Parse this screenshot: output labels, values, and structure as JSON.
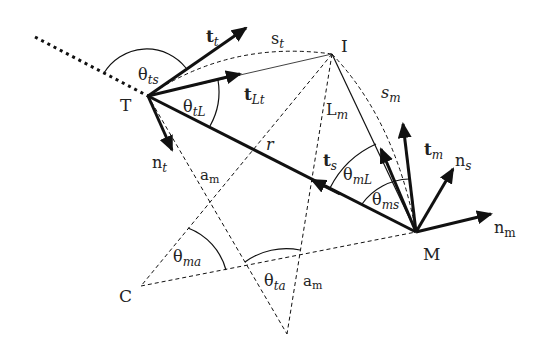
{
  "diagram": {
    "points": {
      "T": {
        "label": "T",
        "x": 148,
        "y": 96
      },
      "I": {
        "label": "I",
        "x": 332,
        "y": 54
      },
      "M": {
        "label": "M",
        "x": 416,
        "y": 232
      },
      "C": {
        "label": "C",
        "x": 141,
        "y": 286
      },
      "B": {
        "label": "",
        "x": 287,
        "y": 334
      }
    },
    "labels": {
      "t_t": {
        "main": "t",
        "sub": "t"
      },
      "t_Lt": {
        "main": "t",
        "sub": "Lt"
      },
      "n_t": {
        "main": "n",
        "sub": "t"
      },
      "s_t": {
        "main": "s",
        "sub": "t"
      },
      "s_m": {
        "main": "s",
        "sub": "m"
      },
      "L_m": {
        "main": "L",
        "sub": "m"
      },
      "r": {
        "main": "r"
      },
      "t_s": {
        "main": "t",
        "sub": "s"
      },
      "t_m": {
        "main": "t",
        "sub": "m"
      },
      "n_s": {
        "main": "n",
        "sub": "s"
      },
      "n_m": {
        "main": "n",
        "sub": "m"
      },
      "a_m_1": {
        "main": "a",
        "sub": "m"
      },
      "a_m_2": {
        "main": "a",
        "sub": "m"
      },
      "theta_ts": {
        "main": "θ",
        "sub": "ts"
      },
      "theta_tL": {
        "main": "θ",
        "sub": "tL"
      },
      "theta_mL": {
        "main": "θ",
        "sub": "mL"
      },
      "theta_ms": {
        "main": "θ",
        "sub": "ms"
      },
      "theta_ma": {
        "main": "θ",
        "sub": "ma"
      },
      "theta_ta": {
        "main": "θ",
        "sub": "ta"
      }
    },
    "colors": {
      "stroke": "#111111",
      "text": "#222222",
      "background": "#ffffff"
    }
  }
}
